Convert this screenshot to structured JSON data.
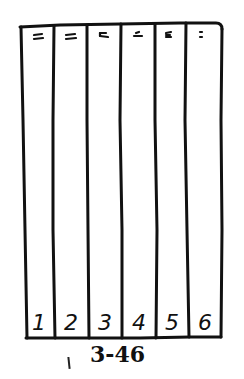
{
  "diagram": {
    "type": "hand-drawn column chart outline",
    "columns": [
      {
        "label": "1",
        "top_mark": "double-dash"
      },
      {
        "label": "2",
        "top_mark": "double-dash"
      },
      {
        "label": "3",
        "top_mark": "double-dash"
      },
      {
        "label": "4",
        "top_mark": "double-dash"
      },
      {
        "label": "5",
        "top_mark": "double-dash"
      },
      {
        "label": "6",
        "top_mark": "colon-dots"
      }
    ],
    "caption": "3-46",
    "caption_prefix_mark": "|",
    "stroke_color": "#111111",
    "background_color": "#ffffff"
  }
}
